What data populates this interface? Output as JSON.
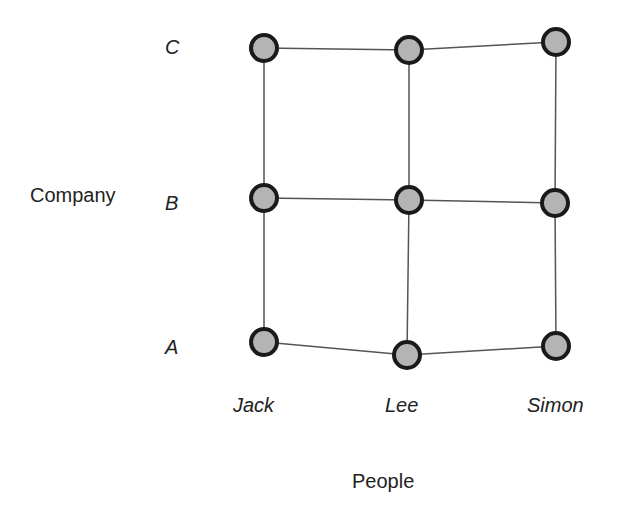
{
  "axes": {
    "y_title": "Company",
    "x_title": "People",
    "rows": [
      {
        "label": "C",
        "y": 48
      },
      {
        "label": "B",
        "y": 200
      },
      {
        "label": "A",
        "y": 346
      }
    ],
    "cols": [
      {
        "label": "Jack",
        "x": 264
      },
      {
        "label": "Lee",
        "x": 408
      },
      {
        "label": "Simon",
        "x": 556
      }
    ]
  },
  "nodes": [
    {
      "row": "C",
      "col": "Jack",
      "x": 264,
      "y": 48
    },
    {
      "row": "C",
      "col": "Lee",
      "x": 409,
      "y": 50
    },
    {
      "row": "C",
      "col": "Simon",
      "x": 556,
      "y": 42
    },
    {
      "row": "B",
      "col": "Jack",
      "x": 264,
      "y": 198
    },
    {
      "row": "B",
      "col": "Lee",
      "x": 409,
      "y": 200
    },
    {
      "row": "B",
      "col": "Simon",
      "x": 555,
      "y": 203
    },
    {
      "row": "A",
      "col": "Jack",
      "x": 264,
      "y": 342
    },
    {
      "row": "A",
      "col": "Lee",
      "x": 407,
      "y": 355
    },
    {
      "row": "A",
      "col": "Simon",
      "x": 556,
      "y": 346
    }
  ],
  "style": {
    "node_fill": "#b4b4b4",
    "node_stroke": "#1a1a1a",
    "edge_color": "#555555"
  }
}
